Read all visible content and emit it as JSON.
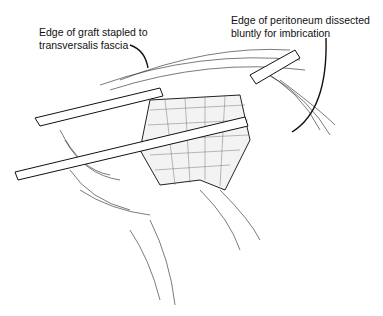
{
  "figure": {
    "labels": [
      {
        "line1": "Edge of graft stapled to",
        "line2": "transversalis fascia"
      },
      {
        "line1": "Edge of peritoneum dissected",
        "line2": "bluntly for imbrication"
      }
    ],
    "colors": {
      "ink": "#111111",
      "background": "#ffffff"
    }
  }
}
